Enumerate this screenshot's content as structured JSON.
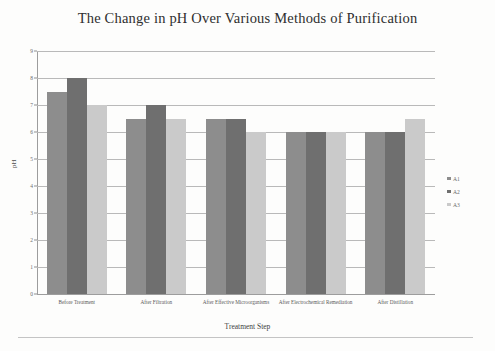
{
  "chart_data": {
    "type": "bar",
    "title": "The Change in pH Over Various Methods of Purification",
    "xlabel": "Treatment Step",
    "ylabel": "pH",
    "ylim": [
      0,
      9
    ],
    "yticks": [
      "0",
      "1",
      "2",
      "3",
      "4",
      "5",
      "6",
      "7",
      "8",
      "9"
    ],
    "grid": true,
    "legend_position": "right",
    "categories": [
      "Before Treatment",
      "After Filtration",
      "After Effective Microorganisms",
      "After Electrochemical Remediation",
      "After Distillation"
    ],
    "series": [
      {
        "name": "A1",
        "color": "#8d8d8d",
        "values": [
          7.5,
          6.5,
          6.5,
          6.0,
          6.0
        ]
      },
      {
        "name": "A2",
        "color": "#6f6f6f",
        "values": [
          8.0,
          7.0,
          6.5,
          6.0,
          6.0
        ]
      },
      {
        "name": "A3",
        "color": "#cacaca",
        "values": [
          7.0,
          6.5,
          6.0,
          6.0,
          6.5
        ]
      }
    ]
  }
}
